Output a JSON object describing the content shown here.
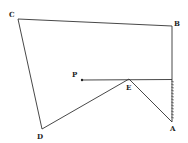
{
  "diagram": {
    "type": "geometry-figure",
    "points": {
      "A": {
        "label": "A",
        "x": 172,
        "y": 122
      },
      "B": {
        "label": "B",
        "x": 172,
        "y": 26
      },
      "C": {
        "label": "C",
        "x": 18,
        "y": 19
      },
      "D": {
        "label": "D",
        "x": 42,
        "y": 129
      },
      "E": {
        "label": "E",
        "x": 129,
        "y": 79
      },
      "P": {
        "label": "P",
        "x": 82,
        "y": 80
      }
    },
    "edges": [
      [
        "A",
        "B"
      ],
      [
        "B",
        "C"
      ],
      [
        "C",
        "D"
      ],
      [
        "D",
        "E"
      ],
      [
        "E",
        "A"
      ],
      [
        "P",
        "wall"
      ]
    ],
    "wall": {
      "description": "hatched segment along AB",
      "x": 172,
      "y1": 79,
      "y2": 122
    },
    "colors": {
      "line": "#333333",
      "background": "#ffffff"
    }
  }
}
